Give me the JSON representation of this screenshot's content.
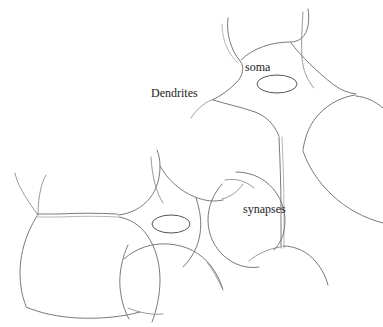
{
  "figure": {
    "background_color": "#ffffff",
    "stroke_color": "#7a7a7e",
    "label_color": "#1b1b1b",
    "width": 383,
    "height": 327
  },
  "labels": {
    "soma": "soma",
    "dendrites": "Dendrites",
    "synapses": "synapses"
  },
  "parts": {
    "upper_cell": "upper-neuron-soma",
    "lower_cell": "lower-neuron-soma",
    "upper_nucleus": "upper-nucleus",
    "lower_nucleus": "lower-nucleus",
    "vertical_axon": "descending-axon",
    "horizontal_axon": "lateral-axon"
  }
}
